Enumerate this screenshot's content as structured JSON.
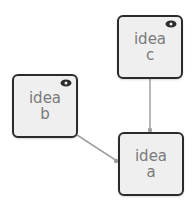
{
  "nodes": [
    {
      "id": "a",
      "label_line1": "idea",
      "label_line2": "a",
      "has_eye": false
    },
    {
      "id": "b",
      "label_line1": "idea",
      "label_line2": "b",
      "has_eye": true
    },
    {
      "id": "c",
      "label_line1": "idea",
      "label_line2": "c",
      "has_eye": true
    }
  ],
  "edges": [
    {
      "from": "b",
      "to": "a"
    },
    {
      "from": "c",
      "to": "a"
    }
  ],
  "colors": {
    "node_fill": "#efefef",
    "node_border": "#2b2b2b",
    "edge": "#a0a0a0",
    "text": "#7a7a7a"
  }
}
